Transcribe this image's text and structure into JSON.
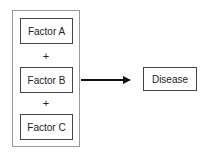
{
  "factors": [
    {
      "label": "Factor A"
    },
    {
      "label": "Factor B"
    },
    {
      "label": "Factor C"
    }
  ],
  "operators": [
    "+",
    "+"
  ],
  "outcome": {
    "label": "Disease"
  }
}
